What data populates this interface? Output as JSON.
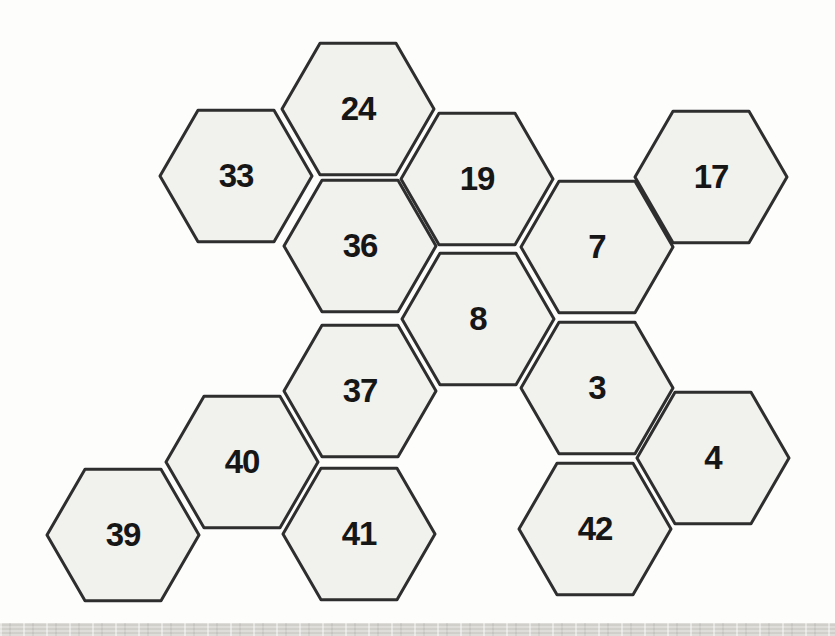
{
  "page": {
    "background": "#fdfdfc",
    "bottom_strip_color": "#d7d6d1"
  },
  "diagram": {
    "type": "hex-grid",
    "hex_fill": "#f1f1ee",
    "hex_stroke": "#2e2e2e",
    "label_color": "#161616",
    "hex_radius": 76,
    "hexagons": [
      {
        "label": "24",
        "cx": 358,
        "cy": 109
      },
      {
        "label": "33",
        "cx": 236,
        "cy": 176
      },
      {
        "label": "19",
        "cx": 477,
        "cy": 179
      },
      {
        "label": "17",
        "cx": 711,
        "cy": 177
      },
      {
        "label": "36",
        "cx": 360,
        "cy": 246
      },
      {
        "label": "7",
        "cx": 597,
        "cy": 247
      },
      {
        "label": "8",
        "cx": 478,
        "cy": 319
      },
      {
        "label": "37",
        "cx": 360,
        "cy": 391
      },
      {
        "label": "3",
        "cx": 597,
        "cy": 388
      },
      {
        "label": "40",
        "cx": 242,
        "cy": 462
      },
      {
        "label": "4",
        "cx": 713,
        "cy": 458
      },
      {
        "label": "39",
        "cx": 123,
        "cy": 535
      },
      {
        "label": "41",
        "cx": 359,
        "cy": 534
      },
      {
        "label": "42",
        "cx": 595,
        "cy": 529
      }
    ]
  }
}
